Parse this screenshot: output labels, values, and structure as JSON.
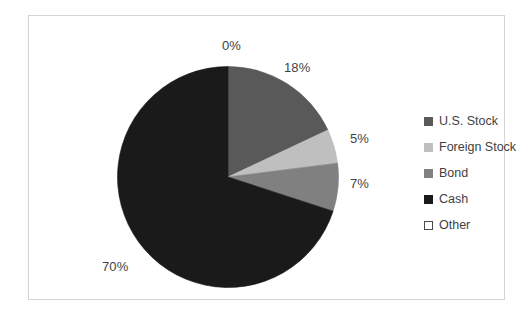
{
  "chart_data": {
    "type": "pie",
    "title": "",
    "subtitle": "",
    "xlabel": "",
    "ylabel": "",
    "grid": false,
    "legend_position": "right",
    "start_angle_deg": 0,
    "direction": "clockwise",
    "categories": [
      "Other",
      "U.S. Stock",
      "Foreign Stock",
      "Bond",
      "Cash"
    ],
    "values": [
      0,
      18,
      5,
      7,
      70
    ],
    "value_unit": "%",
    "slices": [
      {
        "label": "Other",
        "value": 0,
        "data_label": "0%",
        "color": "#ffffff",
        "outline": "#4a4a4a",
        "legend_style": "hollow"
      },
      {
        "label": "U.S. Stock",
        "value": 18,
        "data_label": "18%",
        "color": "#595959",
        "outline": "#595959",
        "legend_style": "filled"
      },
      {
        "label": "Foreign Stock",
        "value": 5,
        "data_label": "5%",
        "color": "#bfbfbf",
        "outline": "#bfbfbf",
        "legend_style": "filled"
      },
      {
        "label": "Bond",
        "value": 7,
        "data_label": "7%",
        "color": "#808080",
        "outline": "#808080",
        "legend_style": "filled"
      },
      {
        "label": "Cash",
        "value": 70,
        "data_label": "70%",
        "color": "#1a1a1a",
        "outline": "#1a1a1a",
        "legend_style": "filled"
      }
    ]
  },
  "labels": {
    "other_pct": "0%",
    "us_stock_pct": "18%",
    "foreign_stock_pct": "5%",
    "bond_pct": "7%",
    "cash_pct": "70%"
  },
  "legend": {
    "items": [
      {
        "label": "U.S. Stock",
        "color": "#595959",
        "style": "filled"
      },
      {
        "label": "Foreign Stock",
        "color": "#bfbfbf",
        "style": "filled"
      },
      {
        "label": "Bond",
        "color": "#808080",
        "style": "filled"
      },
      {
        "label": "Cash",
        "color": "#1a1a1a",
        "style": "filled"
      },
      {
        "label": "Other",
        "color": "#ffffff",
        "style": "hollow"
      }
    ]
  },
  "style": {
    "background": "#ffffff",
    "frame_border": "#d4d4d4",
    "text_color": "#3f3f3f"
  }
}
